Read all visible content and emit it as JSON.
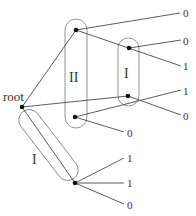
{
  "diagram": {
    "title": "",
    "root_label": "root",
    "groups": [
      {
        "id": "II",
        "label": "II",
        "nodes": [
          "n1",
          "n2"
        ]
      },
      {
        "id": "I_upper",
        "label": "I",
        "nodes": [
          "n3",
          "n4"
        ]
      },
      {
        "id": "I_lower",
        "label": "I",
        "nodes": [
          "root",
          "n5"
        ]
      }
    ],
    "nodes": [
      {
        "id": "root",
        "label": "root"
      },
      {
        "id": "n1"
      },
      {
        "id": "n2"
      },
      {
        "id": "n3"
      },
      {
        "id": "n4"
      },
      {
        "id": "n5"
      }
    ],
    "edges": [
      {
        "from": "root",
        "to": "n1"
      },
      {
        "from": "root",
        "to": "n4"
      },
      {
        "from": "root",
        "to": "n5"
      },
      {
        "from": "n1",
        "to": "leaf",
        "label": "0"
      },
      {
        "from": "n1",
        "to": "n3"
      },
      {
        "from": "n3",
        "to": "leaf",
        "label": "0"
      },
      {
        "from": "n3",
        "to": "leaf",
        "label": "1"
      },
      {
        "from": "n2",
        "to": "leaf",
        "label": "1"
      },
      {
        "from": "n2",
        "to": "leaf",
        "label": "0"
      },
      {
        "from": "n4",
        "to": "leaf",
        "label": "0"
      },
      {
        "from": "n5",
        "to": "leaf",
        "label": "1"
      },
      {
        "from": "n5",
        "to": "leaf",
        "label": "1"
      },
      {
        "from": "n5",
        "to": "leaf",
        "label": "0"
      }
    ],
    "leaf_labels": {
      "top": "0",
      "right": [
        "0",
        "1",
        "1",
        "0"
      ],
      "mid": "0",
      "bottom": [
        "1",
        "1",
        "0"
      ]
    }
  }
}
